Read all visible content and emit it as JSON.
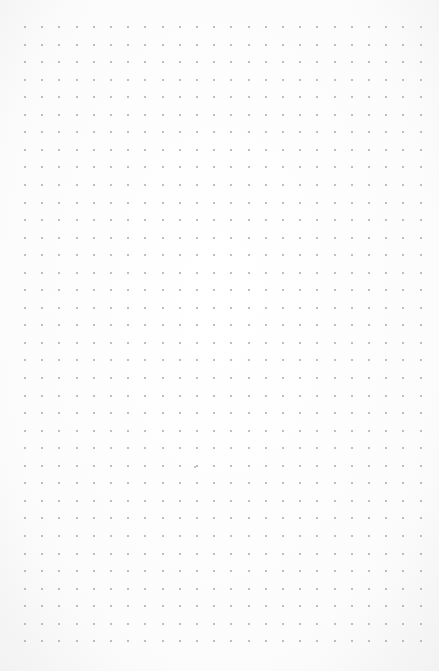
{
  "page": {
    "type": "dot-grid-paper",
    "columns": 24,
    "rows": 36,
    "dot_color": "#a9a9a9",
    "background_color": "#fdfdfd",
    "stray_marks": 1
  }
}
